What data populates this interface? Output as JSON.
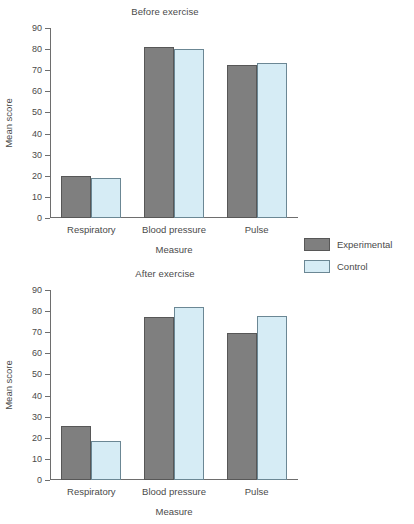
{
  "figure": {
    "legend": {
      "position": "right-middle",
      "entries": [
        {
          "label": "Experimental",
          "color": "#7f7f7f",
          "name": "experimental"
        },
        {
          "label": "Control",
          "color": "#d6ecf5",
          "name": "control"
        }
      ]
    }
  },
  "chart_data": [
    {
      "type": "bar",
      "title": "Before exercise",
      "xlabel": "Measure",
      "ylabel": "Mean score",
      "categories": [
        "Respiratory",
        "Blood pressure",
        "Pulse"
      ],
      "ylim": [
        0,
        90
      ],
      "yticks": [
        0,
        10,
        20,
        30,
        40,
        50,
        60,
        70,
        80,
        90
      ],
      "grid": false,
      "legend_position": "right",
      "series": [
        {
          "name": "Experimental",
          "color": "#7f7f7f",
          "values": [
            20,
            81,
            72.5
          ]
        },
        {
          "name": "Control",
          "color": "#d6ecf5",
          "values": [
            19,
            80,
            73.5
          ]
        }
      ]
    },
    {
      "type": "bar",
      "title": "After exercise",
      "xlabel": "Measure",
      "ylabel": "Mean score",
      "categories": [
        "Respiratory",
        "Blood pressure",
        "Pulse"
      ],
      "ylim": [
        0,
        90
      ],
      "yticks": [
        0,
        10,
        20,
        30,
        40,
        50,
        60,
        70,
        80,
        90
      ],
      "grid": false,
      "legend_position": "right",
      "series": [
        {
          "name": "Experimental",
          "color": "#7f7f7f",
          "values": [
            25.5,
            77,
            69.5
          ]
        },
        {
          "name": "Control",
          "color": "#d6ecf5",
          "values": [
            18.5,
            82,
            77.5
          ]
        }
      ]
    }
  ]
}
